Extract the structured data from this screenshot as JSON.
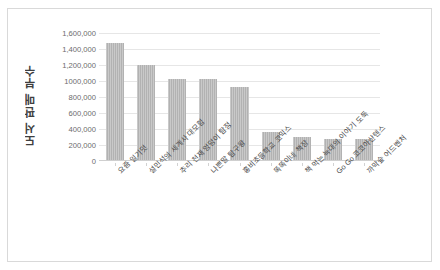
{
  "chart_data": {
    "type": "bar",
    "title": "",
    "xlabel": "",
    "ylabel": "도서 판매 부수",
    "ylim": [
      0,
      1600000
    ],
    "ytick_values": [
      0,
      200000,
      400000,
      600000,
      800000,
      1000000,
      1200000,
      1400000,
      1600000
    ],
    "ytick_labels": [
      "0",
      "200,000",
      "400,000",
      "600,000",
      "800,000",
      "1000,000",
      "1,200,000",
      "1,400,000",
      "1,600,000"
    ],
    "grid": true,
    "legend": null,
    "bar_color": "#b2b2b2",
    "categories": [
      "요즘 일기덧",
      "설민석의 세계사 대모험",
      "추리 천재 엉덩이 탐정",
      "나쁜말 탐구왕",
      "홍비초등학교 코믹스",
      "똑똑이네 책장",
      "책 먹는 늑대의 이야기 도둑",
      "Go Go 코코아산텐스",
      "까막숲 어드벤처"
    ],
    "values": [
      1480000,
      1200000,
      1020000,
      1020000,
      930000,
      360000,
      305000,
      280000,
      270000
    ]
  },
  "colors": {
    "bar": "#b2b2b2",
    "gridline": "#e6e6e6",
    "frame_border": "#d9d9d9",
    "axis_text": "#6b6b6b",
    "title_text": "#3f3f3f"
  }
}
